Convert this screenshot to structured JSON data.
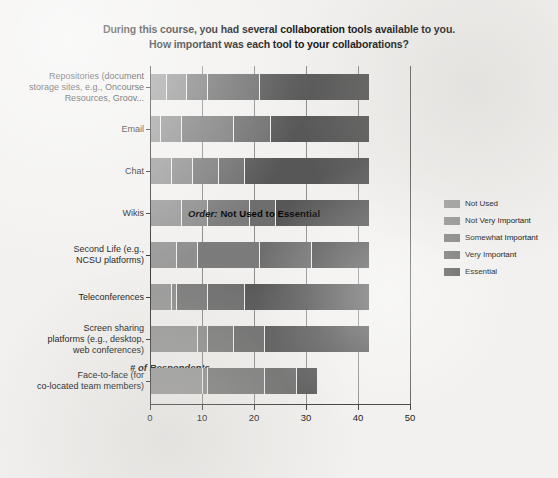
{
  "title": {
    "line1": "During this course, you had several collaboration tools available to you.",
    "line2": "How important was each tool to your collaborations?"
  },
  "annotation": {
    "prefix": "Order:",
    "text": " Not Used to Essential"
  },
  "legend": {
    "items": [
      {
        "label": "Not Used",
        "color": "#9a9a9a"
      },
      {
        "label": "Not Very Important",
        "color": "#8e8e8e"
      },
      {
        "label": "Somewhat Important",
        "color": "#7b7b7b"
      },
      {
        "label": "Very Important",
        "color": "#6e6e6e"
      },
      {
        "label": "Essential",
        "color": "#575757"
      }
    ]
  },
  "chart_data": {
    "type": "bar",
    "orientation": "horizontal",
    "stacked": true,
    "title": "During this course, you had several collaboration tools available to you. How important was each tool to your collaborations?",
    "xlabel": "# of Respondents",
    "ylabel": "",
    "xlim": [
      0,
      50
    ],
    "xticks": [
      0,
      10,
      20,
      30,
      40,
      50
    ],
    "xtick_labels": [
      "0",
      "10",
      "20",
      "30",
      "40",
      "50"
    ],
    "grid": true,
    "legend_position": "right",
    "categories": [
      "Repositories (document\nstorage sites, e.g., Oncourse\nResources, Groov...",
      "Email",
      "Chat",
      "Wikis",
      "Second Life (e.g.,\nNCSU platforms)",
      "Teleconferences",
      "Screen sharing\nplatforms (e.g., desktop,\nweb conferences)",
      "Face-to-face (for\nco-located team members)"
    ],
    "series": [
      {
        "name": "Not Used",
        "color": "#9a9a9a",
        "values": [
          3,
          2,
          4,
          6,
          5,
          4,
          9,
          10
        ]
      },
      {
        "name": "Not Very Important",
        "color": "#8e8e8e",
        "values": [
          4,
          4,
          4,
          5,
          4,
          1,
          2,
          1
        ]
      },
      {
        "name": "Not Very Important2",
        "color": "#8e8e8e",
        "values": [
          0,
          0,
          0,
          0,
          0,
          0,
          0,
          0
        ]
      },
      {
        "name": "Somewhat Important",
        "color": "#7b7b7b",
        "values": [
          4,
          10,
          5,
          8,
          12,
          6,
          5,
          11
        ]
      },
      {
        "name": "Very Important",
        "color": "#6e6e6e",
        "values": [
          10,
          7,
          5,
          5,
          10,
          7,
          6,
          6
        ]
      },
      {
        "name": "Essential",
        "color": "#575757",
        "values": [
          21,
          19,
          24,
          18,
          11,
          24,
          20,
          4
        ]
      }
    ],
    "series_display": [
      {
        "name": "Not Used",
        "color": "#9a9a9a",
        "values": [
          3,
          2,
          4,
          6,
          5,
          4,
          9,
          10
        ]
      },
      {
        "name": "Not Very Important",
        "color": "#8e8e8e",
        "values": [
          4,
          4,
          4,
          5,
          4,
          1,
          2,
          1
        ]
      },
      {
        "name": "Somewhat Important",
        "color": "#7b7b7b",
        "values": [
          4,
          10,
          5,
          8,
          12,
          6,
          5,
          11
        ]
      },
      {
        "name": "Very Important",
        "color": "#6e6e6e",
        "values": [
          10,
          7,
          5,
          5,
          10,
          7,
          6,
          6
        ]
      },
      {
        "name": "Essential",
        "color": "#575757",
        "values": [
          21,
          19,
          24,
          18,
          11,
          24,
          20,
          4
        ]
      }
    ],
    "totals": [
      42,
      42,
      42,
      42,
      42,
      42,
      42,
      32
    ]
  }
}
